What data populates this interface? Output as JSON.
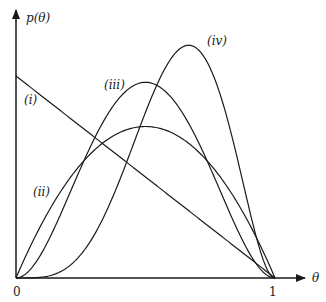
{
  "chart_data": {
    "type": "line",
    "title": "",
    "xlabel": "θ",
    "ylabel": "p(θ)",
    "xlim": [
      0,
      1
    ],
    "ylim": [
      0,
      2.6
    ],
    "grid": false,
    "legend": "none (curves labelled inline)",
    "x_tick_labels": [
      "0",
      "1"
    ],
    "series": [
      {
        "name": "(i)",
        "description": "linear decreasing density 2(1-θ)",
        "x": [
          0,
          0.25,
          0.5,
          0.75,
          1
        ],
        "values": [
          2.0,
          1.5,
          1.0,
          0.5,
          0.0
        ]
      },
      {
        "name": "(ii)",
        "description": "symmetric hump 6θ(1-θ)",
        "x": [
          0,
          0.25,
          0.5,
          0.75,
          1
        ],
        "values": [
          0.0,
          1.125,
          1.5,
          1.125,
          0.0
        ]
      },
      {
        "name": "(iii)",
        "description": "symmetric taller hump 30θ²(1-θ)²",
        "x": [
          0,
          0.25,
          0.5,
          0.75,
          1
        ],
        "values": [
          0.0,
          1.05,
          1.875,
          1.05,
          0.0
        ]
      },
      {
        "name": "(iv)",
        "description": "right-skewed hump 105θ⁴(1-θ)²",
        "x": [
          0,
          0.25,
          0.5,
          0.667,
          0.75,
          1
        ],
        "values": [
          0.0,
          0.23,
          1.64,
          2.3,
          2.08,
          0.0
        ]
      }
    ]
  },
  "labels": {
    "y_axis": "p(θ)",
    "x_axis": "θ",
    "x_tick_0": "0",
    "x_tick_1": "1",
    "curve_i": "(i)",
    "curve_ii": "(ii)",
    "curve_iii": "(iii)",
    "curve_iv": "(iv)"
  }
}
